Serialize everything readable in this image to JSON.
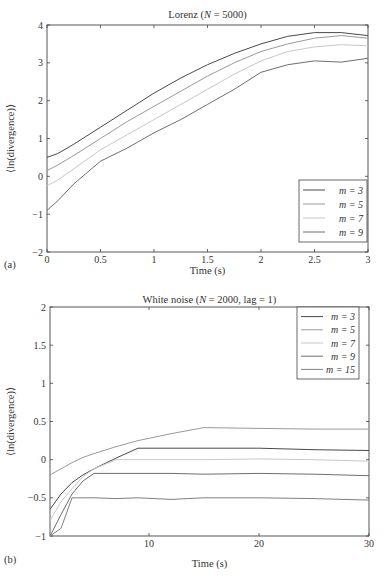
{
  "chart_data": [
    {
      "panel": "(a)",
      "type": "line",
      "title": "Lorenz (N = 5000)",
      "title_parts": {
        "prefix": "Lorenz (",
        "var": "N",
        "suffix": " = 5000)"
      },
      "xlabel": "Time (s)",
      "ylabel": "⟨ln(divergence)⟩",
      "xlim": [
        0,
        3
      ],
      "ylim": [
        -2,
        4
      ],
      "xticks": [
        "0",
        "0.5",
        "1",
        "1.5",
        "2",
        "2.5",
        "3"
      ],
      "yticks": [
        "−2",
        "−1",
        "0",
        "1",
        "2",
        "3",
        "4"
      ],
      "grid": false,
      "legend_position": "lower right",
      "x": [
        0,
        0.1,
        0.25,
        0.5,
        0.75,
        1.0,
        1.25,
        1.5,
        1.75,
        2.0,
        2.25,
        2.5,
        2.75,
        3.0
      ],
      "series": [
        {
          "name": "m = 3",
          "color": "#4a4a4a",
          "values": [
            0.5,
            0.6,
            0.85,
            1.3,
            1.75,
            2.2,
            2.6,
            2.95,
            3.25,
            3.5,
            3.7,
            3.8,
            3.8,
            3.72
          ]
        },
        {
          "name": "m = 5",
          "color": "#9a9a9a",
          "values": [
            0.15,
            0.3,
            0.55,
            1.0,
            1.45,
            1.85,
            2.25,
            2.65,
            3.0,
            3.3,
            3.5,
            3.65,
            3.72,
            3.65
          ]
        },
        {
          "name": "m = 7",
          "color": "#c8c8c8",
          "values": [
            -0.25,
            -0.1,
            0.2,
            0.7,
            1.1,
            1.5,
            1.9,
            2.3,
            2.7,
            3.05,
            3.3,
            3.42,
            3.48,
            3.45
          ]
        },
        {
          "name": "m = 9",
          "color": "#6e6e6e",
          "values": [
            -0.9,
            -0.65,
            -0.2,
            0.4,
            0.75,
            1.15,
            1.5,
            1.9,
            2.3,
            2.75,
            2.95,
            3.05,
            3.02,
            3.12
          ]
        }
      ]
    },
    {
      "panel": "(b)",
      "type": "line",
      "title": "White noise (N = 2000, lag = 1)",
      "title_parts": {
        "prefix": "White noise (",
        "var": "N",
        "suffix": " = 2000, lag = 1)"
      },
      "xlabel": "Time (s)",
      "ylabel": "⟨ln(divergence)⟩",
      "xlim": [
        1,
        30
      ],
      "ylim": [
        -1,
        2
      ],
      "xticks": [
        "10",
        "20",
        "30"
      ],
      "yticks": [
        "−1",
        "−0.5",
        "0",
        "0.5",
        "1",
        "1.5",
        "2"
      ],
      "grid": false,
      "legend_position": "upper right",
      "x": [
        1,
        2,
        3,
        4,
        5,
        7,
        9,
        12,
        15,
        20,
        25,
        30
      ],
      "series": [
        {
          "name": "m = 3",
          "color": "#4a4a4a",
          "values": [
            -0.65,
            -0.45,
            -0.3,
            -0.2,
            -0.12,
            0.02,
            0.15,
            0.15,
            0.15,
            0.15,
            0.13,
            0.12
          ]
        },
        {
          "name": "m = 5",
          "color": "#9a9a9a",
          "values": [
            -0.2,
            -0.12,
            -0.04,
            0.03,
            0.08,
            0.17,
            0.25,
            0.34,
            0.42,
            0.41,
            0.4,
            0.4
          ]
        },
        {
          "name": "m = 7",
          "color": "#c8c8c8",
          "values": [
            -0.8,
            -0.55,
            -0.38,
            -0.22,
            -0.12,
            0.0,
            0.0,
            0.0,
            0.0,
            0.01,
            0.0,
            -0.02
          ]
        },
        {
          "name": "m = 9",
          "color": "#6e6e6e",
          "values": [
            -1.0,
            -0.72,
            -0.45,
            -0.28,
            -0.18,
            -0.18,
            -0.18,
            -0.18,
            -0.19,
            -0.18,
            -0.19,
            -0.21
          ]
        },
        {
          "name": "m = 15",
          "color": "#808080",
          "values": [
            -1.0,
            -0.9,
            -0.5,
            -0.5,
            -0.5,
            -0.51,
            -0.5,
            -0.52,
            -0.5,
            -0.5,
            -0.51,
            -0.53
          ]
        }
      ]
    }
  ]
}
